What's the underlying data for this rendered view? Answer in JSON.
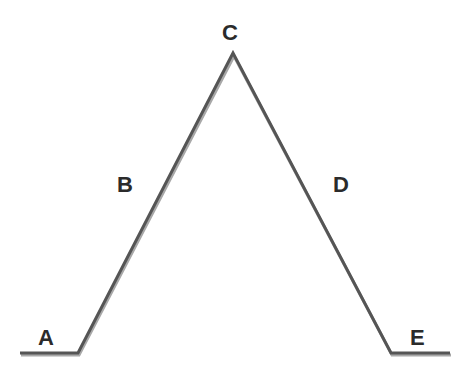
{
  "diagram": {
    "type": "profile-path",
    "stroke_color": "#555555",
    "shadow_color": "#9a9a9a",
    "points": [
      {
        "x": 20,
        "y": 353
      },
      {
        "x": 78,
        "y": 353
      },
      {
        "x": 233,
        "y": 53
      },
      {
        "x": 391,
        "y": 353
      },
      {
        "x": 450,
        "y": 353
      }
    ],
    "labels": [
      {
        "id": "A",
        "text": "A",
        "x": 38,
        "y": 327
      },
      {
        "id": "B",
        "text": "B",
        "x": 117,
        "y": 174
      },
      {
        "id": "C",
        "text": "C",
        "x": 222,
        "y": 22
      },
      {
        "id": "D",
        "text": "D",
        "x": 333,
        "y": 174
      },
      {
        "id": "E",
        "text": "E",
        "x": 410,
        "y": 327
      }
    ]
  }
}
